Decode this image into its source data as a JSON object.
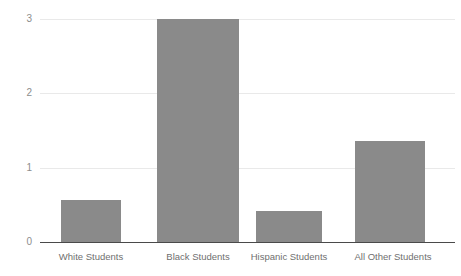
{
  "chart_data": {
    "type": "bar",
    "title": "",
    "xlabel": "",
    "ylabel": "",
    "categories": [
      "White Students",
      "Black Students",
      "Hispanic Students",
      "All Other Students"
    ],
    "values": [
      0.57,
      3.0,
      0.42,
      1.36
    ],
    "series": [
      {
        "name": "",
        "values": [
          0.57,
          3.0,
          0.42,
          1.36
        ]
      }
    ],
    "ylim": [
      0,
      3.2
    ],
    "yticks": [
      0,
      1,
      2,
      3
    ],
    "ytick_labels": [
      "0",
      "1",
      "2",
      "3"
    ],
    "grid": true,
    "grid_axis": "y",
    "legend": false,
    "legend_position": "none",
    "bar_color": "#8a8a8a",
    "gridline_color": "#e9e9e9",
    "axis_color": "#4a4a4a",
    "tick_label_color": "#8d8d8d",
    "category_label_color": "#6f6f6f",
    "background_color": "#ffffff"
  },
  "axis": {
    "y_labels": [
      "3",
      "2",
      "1",
      "0"
    ]
  }
}
